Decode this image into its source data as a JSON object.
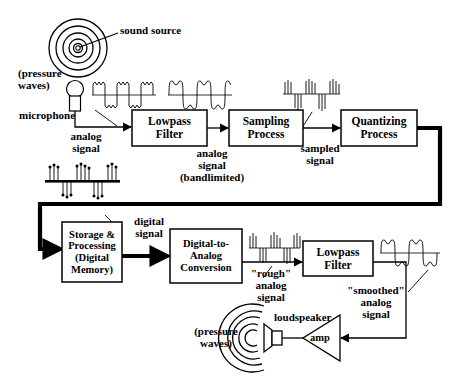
{
  "diagram": {
    "colors": {
      "stroke": "#000000",
      "background": "#ffffff",
      "thick_path": "#000000"
    }
  },
  "source": {
    "sound_source_label": "sound source",
    "pressure_waves_label": "(pressure\nwaves)",
    "microphone_label": "microphone"
  },
  "blocks": [
    {
      "id": "lowpass-filter-1",
      "lines": [
        "Lowpass",
        "Filter"
      ]
    },
    {
      "id": "sampling-process",
      "lines": [
        "Sampling",
        "Process"
      ]
    },
    {
      "id": "quantizing-process",
      "lines": [
        "Quantizing",
        "Process"
      ]
    },
    {
      "id": "storage-processing",
      "lines": [
        "Storage &",
        "Processing",
        "(Digital",
        "Memory)"
      ]
    },
    {
      "id": "digital-to-analog-conversion",
      "lines": [
        "Digital-to-",
        "Analog",
        "Conversion"
      ]
    },
    {
      "id": "lowpass-filter-2",
      "lines": [
        "Lowpass",
        "Filter"
      ]
    }
  ],
  "signals": {
    "analog_signal": "analog\nsignal",
    "analog_signal_bandlimited": "analog\nsignal\n(bandlimited)",
    "sampled_signal": "sampled\nsignal",
    "digital_signal": "digital\nsignal",
    "rough_analog_signal": "\"rough\"\nanalog\nsignal",
    "smoothed_analog_signal": "\"smoothed\"\nanalog\nsignal"
  },
  "output": {
    "loudspeaker_label": "loudspeaker",
    "amp_label": "amp",
    "pressure_waves_label": "(pressure\nwaves)"
  },
  "waveform_plots": [
    {
      "id": "wave-raw-analog",
      "kind": "square-with-ripple",
      "caption_ref": "analog signal"
    },
    {
      "id": "wave-bandlimited-analog",
      "kind": "rounded-square",
      "caption_ref": "analog signal (bandlimited)"
    },
    {
      "id": "wave-sampled",
      "kind": "impulse-train",
      "caption_ref": "sampled signal"
    },
    {
      "id": "wave-quantized",
      "kind": "stem-with-dots",
      "caption_ref": "digital signal"
    },
    {
      "id": "wave-rough-analog",
      "kind": "impulse-train",
      "caption_ref": "\"rough\" analog signal"
    },
    {
      "id": "wave-smoothed-analog",
      "kind": "rounded-square",
      "caption_ref": "\"smoothed\" analog signal"
    }
  ]
}
